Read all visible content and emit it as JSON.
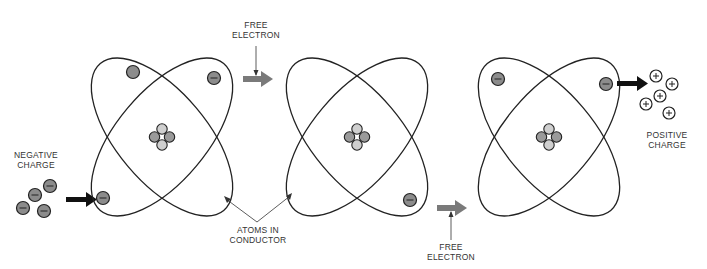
{
  "labels": {
    "negative_charge": "NEGATIVE\nCHARGE",
    "negative_charge_line1": "NEGATIVE",
    "negative_charge_line2": "CHARGE",
    "free_electron_top_line1": "FREE",
    "free_electron_top_line2": "ELECTRON",
    "atoms_in_conductor_line1": "ATOMS IN",
    "atoms_in_conductor_line2": "CONDUCTOR",
    "free_electron_bottom_line1": "FREE",
    "free_electron_bottom_line2": "ELECTRON",
    "positive_charge_line1": "POSITIVE",
    "positive_charge_line2": "CHARGE"
  },
  "atoms": [
    {
      "name": "atom-1",
      "center": [
        162,
        137
      ],
      "electrons": [
        {
          "pos": [
            133,
            72
          ],
          "sign": "none"
        },
        {
          "pos": [
            214,
            78
          ],
          "sign": "-"
        },
        {
          "pos": [
            103,
            198
          ],
          "sign": "-"
        }
      ]
    },
    {
      "name": "atom-2",
      "center": [
        357,
        137
      ],
      "electrons": [
        {
          "pos": [
            410,
            200
          ],
          "sign": "-"
        }
      ]
    },
    {
      "name": "atom-3",
      "center": [
        549,
        137
      ],
      "electrons": [
        {
          "pos": [
            498,
            79
          ],
          "sign": "-"
        },
        {
          "pos": [
            606,
            84
          ],
          "sign": "-"
        }
      ]
    }
  ],
  "negative_charge_group": [
    [
      50,
      186
    ],
    [
      35,
      195
    ],
    [
      23,
      208
    ],
    [
      44,
      211
    ]
  ],
  "positive_charge_group": [
    [
      656,
      76
    ],
    [
      672,
      84
    ],
    [
      660,
      96
    ],
    [
      646,
      104
    ],
    [
      669,
      113
    ]
  ],
  "colors": {
    "electron_fill": "#8c8c8c",
    "outline": "#222222",
    "free_electron_arrow": "#7a7a7a",
    "charge_flow_arrow": "#111111",
    "text": "#333333"
  }
}
